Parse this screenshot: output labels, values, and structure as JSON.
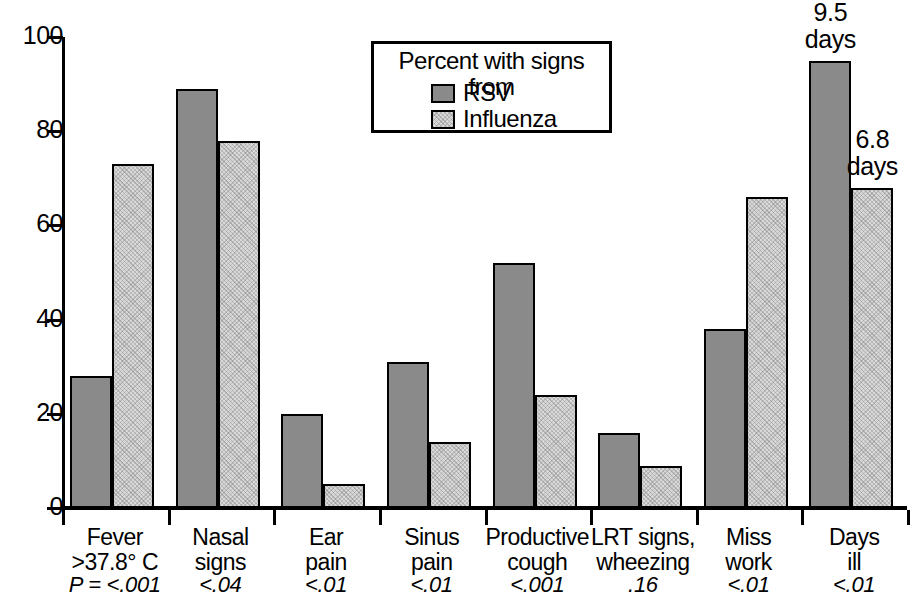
{
  "chart_data": {
    "type": "bar",
    "title": "",
    "xlabel": "",
    "ylabel": "",
    "ylim": [
      0,
      100
    ],
    "yticks": [
      0,
      20,
      40,
      60,
      80,
      100
    ],
    "grid": false,
    "legend_position": "top-center",
    "legend_title": "Percent with signs from",
    "categories": [
      "Fever\n>37.8° C",
      "Nasal\nsigns",
      "Ear\npain",
      "Sinus\npain",
      "Productive\ncough",
      "LRT signs,\nwheezing",
      "Miss\nwork",
      "Days\nill"
    ],
    "p_values": [
      "P = <.001",
      "<.04",
      "<.01",
      "<.01",
      "<.001",
      ".16",
      "<.01",
      "<.01"
    ],
    "series": [
      {
        "name": "RSV",
        "color": "#8a8a8a",
        "values": [
          28,
          89,
          20,
          31,
          52,
          16,
          38,
          95
        ]
      },
      {
        "name": "Influenza",
        "color": "#d9d9d9",
        "values": [
          73,
          78,
          5,
          14,
          24,
          9,
          66,
          68
        ]
      }
    ],
    "annotations": [
      {
        "series": "RSV",
        "category": "Days\nill",
        "text": "9.5\ndays"
      },
      {
        "series": "Influenza",
        "category": "Days\nill",
        "text": "6.8\ndays"
      }
    ]
  },
  "axis": {
    "y_tick_labels": [
      "100",
      "80",
      "60",
      "40",
      "20",
      "0"
    ]
  },
  "legend": {
    "title": "Percent with signs from",
    "entries": [
      {
        "label": "RSV",
        "swatch": "dark-gray"
      },
      {
        "label": "Influenza",
        "swatch": "light-gray"
      }
    ]
  },
  "annotations": {
    "rsv_days": "9.5\ndays",
    "flu_days": "6.8\ndays"
  },
  "colors": {
    "rsv": "#8a8a8a",
    "influenza": "#d9d9d9",
    "axis": "#000000",
    "background": "#ffffff"
  }
}
